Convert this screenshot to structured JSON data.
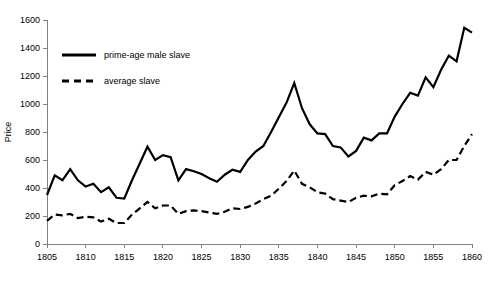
{
  "chart_data": {
    "type": "line",
    "title": "",
    "xlabel": "",
    "ylabel": "Price",
    "xlim": [
      1805,
      1860
    ],
    "ylim": [
      0,
      1600
    ],
    "grid": false,
    "legend_position": "top-left",
    "x": [
      1805,
      1806,
      1807,
      1808,
      1809,
      1810,
      1811,
      1812,
      1813,
      1814,
      1815,
      1816,
      1817,
      1818,
      1819,
      1820,
      1821,
      1822,
      1823,
      1824,
      1825,
      1826,
      1827,
      1828,
      1829,
      1830,
      1831,
      1832,
      1833,
      1834,
      1835,
      1836,
      1837,
      1838,
      1839,
      1840,
      1841,
      1842,
      1843,
      1844,
      1845,
      1846,
      1847,
      1848,
      1849,
      1850,
      1851,
      1852,
      1853,
      1854,
      1855,
      1856,
      1857,
      1858,
      1859,
      1860
    ],
    "xticks": [
      1805,
      1810,
      1815,
      1820,
      1825,
      1830,
      1835,
      1840,
      1845,
      1850,
      1855,
      1860
    ],
    "yticks": [
      0,
      200,
      400,
      600,
      800,
      1000,
      1200,
      1400,
      1600
    ],
    "series": [
      {
        "name": "prime-age male slave",
        "style": "solid",
        "color": "#000000",
        "values": [
          350,
          490,
          455,
          535,
          455,
          410,
          430,
          370,
          405,
          330,
          325,
          455,
          575,
          695,
          600,
          635,
          620,
          455,
          535,
          520,
          500,
          470,
          445,
          495,
          530,
          515,
          600,
          660,
          700,
          800,
          905,
          1010,
          1150,
          970,
          855,
          790,
          785,
          700,
          690,
          625,
          665,
          760,
          740,
          790,
          790,
          910,
          1000,
          1080,
          1060,
          1190,
          1120,
          1245,
          1345,
          1305,
          1545,
          1510
        ]
      },
      {
        "name": "average slave",
        "style": "dashed",
        "color": "#000000",
        "values": [
          165,
          210,
          205,
          215,
          185,
          195,
          190,
          160,
          180,
          150,
          150,
          210,
          255,
          300,
          255,
          275,
          275,
          215,
          235,
          240,
          235,
          225,
          215,
          230,
          255,
          250,
          265,
          290,
          320,
          345,
          395,
          450,
          525,
          430,
          405,
          370,
          360,
          320,
          310,
          300,
          330,
          345,
          340,
          360,
          355,
          420,
          450,
          485,
          460,
          515,
          495,
          535,
          600,
          600,
          700,
          785
        ]
      }
    ]
  },
  "legend": {
    "items": [
      {
        "label": "prime-age male slave",
        "style": "solid"
      },
      {
        "label": "average slave",
        "style": "dashed"
      }
    ]
  },
  "axes": {
    "y_title": "Price",
    "y_tick_labels": [
      "0",
      "200",
      "400",
      "600",
      "800",
      "1000",
      "1200",
      "1400",
      "1600"
    ],
    "x_tick_labels": [
      "1805",
      "1810",
      "1815",
      "1820",
      "1825",
      "1830",
      "1835",
      "1840",
      "1845",
      "1850",
      "1855",
      "1860"
    ]
  },
  "colors": {
    "background": "#ffffff",
    "axis": "#808080",
    "series": "#000000"
  }
}
